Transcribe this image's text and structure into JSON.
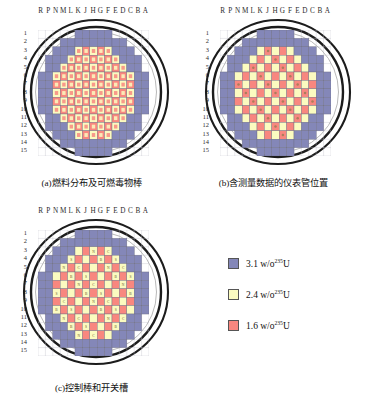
{
  "figure": {
    "column_labels": [
      "R",
      "P",
      "N",
      "M",
      "L",
      "K",
      "J",
      "H",
      "G",
      "F",
      "E",
      "D",
      "C",
      "B",
      "A"
    ],
    "row_labels": [
      "1",
      "2",
      "3",
      "4",
      "5",
      "6",
      "7",
      "8",
      "9",
      "10",
      "11",
      "12",
      "13",
      "14",
      "15"
    ],
    "panels": [
      {
        "id": "a",
        "caption": "(a)燃料分布及可燃毒物棒"
      },
      {
        "id": "b",
        "caption": "(b)含测量数据的仪表管位置"
      },
      {
        "id": "c",
        "caption": "(c)控制棒和开关槽"
      }
    ]
  },
  "legend": {
    "items": [
      {
        "color": "#8487b8",
        "value": "3.1",
        "unit": "w/o",
        "isotope": "235",
        "element": "U"
      },
      {
        "color": "#fbfbc0",
        "value": "2.4",
        "unit": "w/o",
        "isotope": "235",
        "element": "U"
      },
      {
        "color": "#f8877f",
        "value": "1.6",
        "unit": "w/o",
        "isotope": "235",
        "element": "U"
      }
    ]
  },
  "colors": {
    "enrichment_31": "#8487b8",
    "enrichment_24": "#fbfbc0",
    "enrichment_16": "#f8877f",
    "vessel_ring": "#1c1c1c",
    "grid_line": "#7a7a8c",
    "background": "#ffffff"
  },
  "chart_data": {
    "type": "heatmap",
    "grid": {
      "rows": 15,
      "cols": 15
    },
    "panel_a": {
      "label": "燃料分布及可燃毒物棒",
      "cell_enrichment": [
        [
          "",
          "",
          "",
          "",
          "P",
          "P",
          "P",
          "P",
          "P",
          "P",
          "P",
          "",
          "",
          "",
          ""
        ],
        [
          "",
          "",
          "P",
          "P",
          "P",
          "Y",
          "R",
          "Y",
          "R",
          "Y",
          "P",
          "P",
          "P",
          "",
          ""
        ],
        [
          "",
          "P",
          "P",
          "Y",
          "R",
          "Y",
          "R",
          "Y",
          "R",
          "Y",
          "R",
          "Y",
          "P",
          "P",
          ""
        ],
        [
          "",
          "P",
          "Y",
          "R",
          "Y",
          "R",
          "Y",
          "R",
          "Y",
          "R",
          "Y",
          "R",
          "Y",
          "P",
          ""
        ],
        [
          "P",
          "P",
          "R",
          "Y",
          "R",
          "Y",
          "R",
          "Y",
          "R",
          "Y",
          "R",
          "Y",
          "R",
          "P",
          "P"
        ],
        [
          "P",
          "Y",
          "Y",
          "R",
          "Y",
          "R",
          "Y",
          "R",
          "Y",
          "R",
          "Y",
          "R",
          "Y",
          "Y",
          "P"
        ],
        [
          "P",
          "R",
          "R",
          "Y",
          "R",
          "Y",
          "R",
          "Y",
          "R",
          "Y",
          "R",
          "Y",
          "R",
          "R",
          "P"
        ],
        [
          "P",
          "Y",
          "Y",
          "R",
          "Y",
          "R",
          "Y",
          "R",
          "Y",
          "R",
          "Y",
          "R",
          "Y",
          "Y",
          "P"
        ],
        [
          "P",
          "R",
          "R",
          "Y",
          "R",
          "Y",
          "R",
          "Y",
          "R",
          "Y",
          "R",
          "Y",
          "R",
          "R",
          "P"
        ],
        [
          "P",
          "Y",
          "Y",
          "R",
          "Y",
          "R",
          "Y",
          "R",
          "Y",
          "R",
          "Y",
          "R",
          "Y",
          "Y",
          "P"
        ],
        [
          "P",
          "P",
          "R",
          "Y",
          "R",
          "Y",
          "R",
          "Y",
          "R",
          "Y",
          "R",
          "Y",
          "R",
          "P",
          "P"
        ],
        [
          "",
          "P",
          "Y",
          "R",
          "Y",
          "R",
          "Y",
          "R",
          "Y",
          "R",
          "Y",
          "R",
          "Y",
          "P",
          ""
        ],
        [
          "",
          "P",
          "P",
          "Y",
          "R",
          "Y",
          "R",
          "Y",
          "R",
          "Y",
          "R",
          "Y",
          "P",
          "P",
          ""
        ],
        [
          "",
          "",
          "P",
          "P",
          "P",
          "Y",
          "R",
          "Y",
          "R",
          "Y",
          "P",
          "P",
          "P",
          "",
          ""
        ],
        [
          "",
          "",
          "",
          "",
          "P",
          "P",
          "P",
          "P",
          "P",
          "P",
          "P",
          "",
          "",
          "",
          ""
        ]
      ],
      "legend_key": {
        "P": "3.1 w/o 235U",
        "Y": "2.4 w/o 235U",
        "R": "1.6 w/o 235U"
      }
    },
    "panel_b": {
      "label": "含测量数据的仪表管位置",
      "description": "含测量数据的仪表管位置分布于堆芯棋盘格"
    },
    "panel_c": {
      "label": "控制棒和开关槽",
      "description": "控制棒组和开关槽位置标记"
    }
  }
}
